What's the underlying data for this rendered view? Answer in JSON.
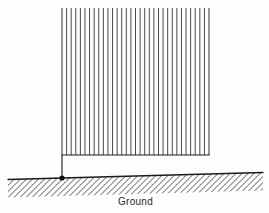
{
  "figure": {
    "type": "engineering-diagram",
    "background_color": "#fdfdfb",
    "line_color": "#1a1a1a",
    "hatch_color": "#4a4a4a"
  },
  "wall": {
    "name": "hatched-wall-block",
    "x_left": 62,
    "x_right": 209,
    "y_top": 8,
    "y_bottom": 155,
    "hatch_orientation": "vertical",
    "hatch_line_count": 33,
    "hatch_spacing_px": 4.5,
    "has_top_border": false,
    "has_side_borders": false,
    "has_bottom_border": true
  },
  "post": {
    "name": "support-post",
    "x": 62,
    "y_top": 155,
    "y_bottom": 178,
    "stroke_width": 1.1
  },
  "pin": {
    "name": "pin-support",
    "cx": 62,
    "cy": 178,
    "radius": 2.6,
    "fill": "#111111"
  },
  "ground": {
    "name": "ground-surface",
    "label": "Ground",
    "label_x": 135,
    "label_y": 203,
    "line_x_start": 8,
    "line_y_start": 179.5,
    "line_x_end": 263,
    "line_y_end": 172.5,
    "hatch_orientation": "diagonal-45",
    "hatch_spacing_px": 6,
    "hatch_depth_px": 18
  }
}
